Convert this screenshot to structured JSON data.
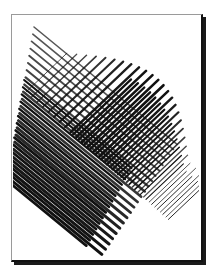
{
  "artwork": {
    "description": "Abstract cross-hatched ink illustration in a framed card with drop shadow",
    "colors": {
      "background": "#ffffff",
      "ink": "#111111",
      "frame_light": "#9a9a9a",
      "frame_dark": "#111111"
    },
    "hatch_families": [
      {
        "name": "down-right-strokes",
        "count": 22,
        "start": [
          34,
          27
        ],
        "start_step": [
          -1.2,
          7.2
        ],
        "dir": [
          1,
          0.82
        ],
        "length_base": 185,
        "length_step": -1.5,
        "width_min": 0.9,
        "width_max": 3.0
      },
      {
        "name": "up-right-strokes",
        "count": 26,
        "start": [
          26,
          92
        ],
        "start_step": [
          5.6,
          5.0
        ],
        "dir": [
          1,
          -0.95
        ],
        "length_base": 75,
        "length_step": 0.6,
        "width_min": 1.0,
        "width_max": 2.6
      }
    ]
  }
}
